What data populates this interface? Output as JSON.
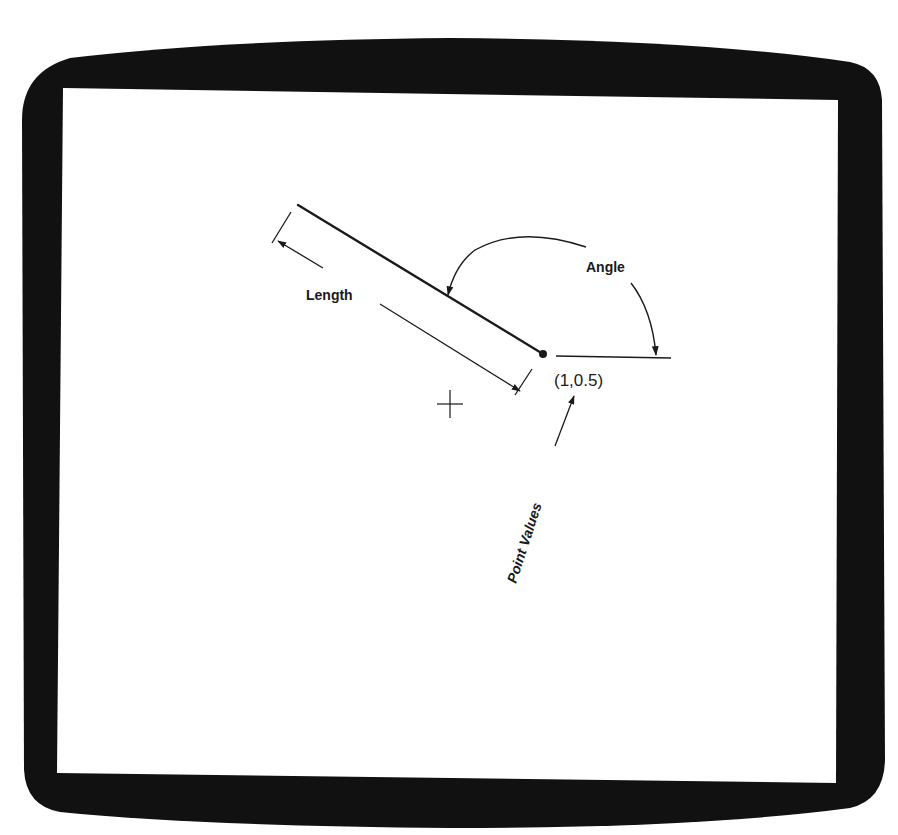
{
  "frame": {
    "bezel_color": "#111111",
    "screen_color": "#ffffff"
  },
  "diagram": {
    "labels": {
      "length": "Length",
      "angle": "Angle",
      "point_values": "Point Values",
      "coordinate": "(1,0.5)"
    },
    "line_segment": {
      "start": [
        298,
        205
      ],
      "end": [
        543,
        354
      ]
    },
    "endpoint": {
      "x": 543,
      "y": 354,
      "coordinate_value": "(1,0.5)"
    },
    "reference_line": {
      "start": [
        556,
        356
      ],
      "end": [
        671,
        358
      ]
    },
    "crosshair": {
      "x": 450,
      "y": 404
    },
    "colors": {
      "ink": "#1a1a1a"
    }
  }
}
